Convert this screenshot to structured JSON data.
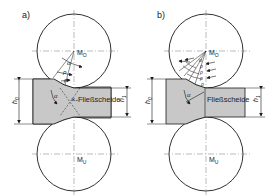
{
  "panels": [
    {
      "id": "a",
      "label": "a)",
      "upper_roll": "M",
      "upper_roll_sub": "O",
      "lower_roll": "M",
      "lower_roll_sub": "U",
      "neutral_line_label": "Fließscheide",
      "entry_height": "h",
      "entry_height_sub": "0",
      "exit_height": "h",
      "exit_height_sub": "1",
      "angle_labels": [
        "α",
        "ρ",
        "ρ",
        "α"
      ]
    },
    {
      "id": "b",
      "label": "b)",
      "upper_roll": "M",
      "upper_roll_sub": "O",
      "lower_roll": "M",
      "lower_roll_sub": "U",
      "neutral_line_label": "Fließscheide",
      "entry_height": "h",
      "entry_height_sub": "0",
      "exit_height": "h",
      "exit_height_sub": "1",
      "angle_labels": [
        "α",
        "ρ",
        "ρ",
        "ρ",
        "ρ",
        "α"
      ]
    }
  ],
  "colors": {
    "line": "#1a1a1a",
    "strip_fill": "#c8c8c8",
    "background": "#ffffff"
  }
}
